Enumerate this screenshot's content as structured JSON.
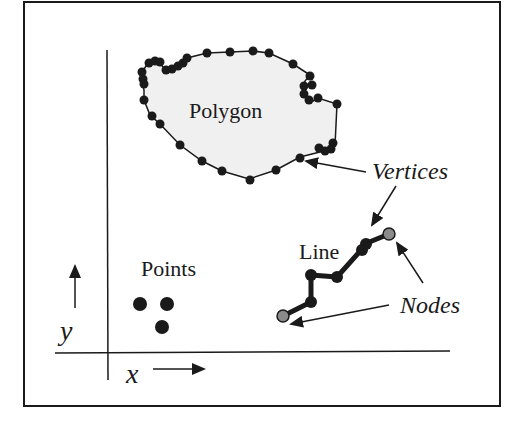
{
  "diagram": {
    "colors": {
      "ink": "#1a1a1a",
      "polygon_fill": "#f0f0f0",
      "node_fill": "#8a8a8a",
      "frame": "#1a1a1a"
    },
    "labels": {
      "polygon": "Polygon",
      "line": "Line",
      "points": "Points",
      "vertices": "Vertices",
      "nodes": "Nodes",
      "x_axis": "x",
      "y_axis": "y"
    },
    "elements": [
      {
        "type": "polygon",
        "label": "Polygon",
        "vertex_count_visible": 40
      },
      {
        "type": "line",
        "label": "Line",
        "nodes": 2,
        "vertices": 5
      },
      {
        "type": "points",
        "label": "Points",
        "count": 3
      }
    ],
    "annotations": [
      {
        "text": "Vertices",
        "points_to": [
          "polygon vertex",
          "line vertex"
        ]
      },
      {
        "text": "Nodes",
        "points_to": [
          "line start node",
          "line end node"
        ]
      }
    ],
    "axes": {
      "x": "x",
      "y": "y"
    }
  }
}
